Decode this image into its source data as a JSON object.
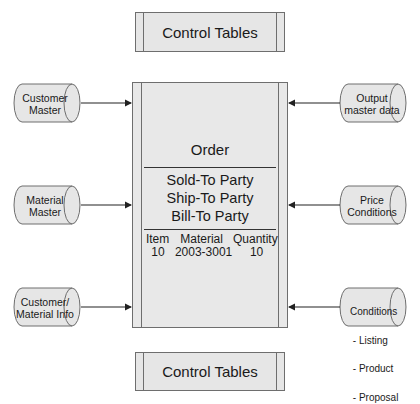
{
  "control_tables_top": {
    "label": "Control Tables"
  },
  "control_tables_bottom": {
    "label": "Control Tables"
  },
  "order": {
    "title": "Order",
    "parties": [
      "Sold-To Party",
      "Ship-To Party",
      "Bill-To Party"
    ],
    "item_headers": [
      "Item",
      "Material",
      "Quantity"
    ],
    "item_row": [
      "10",
      "2003-3001",
      "10"
    ]
  },
  "inputs_left": [
    {
      "lines": [
        "Customer",
        "Master"
      ]
    },
    {
      "lines": [
        "Material",
        "Master"
      ]
    },
    {
      "lines": [
        "Customer/",
        "Material Info"
      ]
    }
  ],
  "inputs_right": [
    {
      "lines": [
        "Output",
        "master data"
      ]
    },
    {
      "lines": [
        "Price",
        "Conditions"
      ]
    },
    {
      "lines": [
        "Conditions",
        " - Listing",
        " - Product",
        " - Proposal"
      ]
    }
  ],
  "colors": {
    "fill": "#e6e6e6",
    "stroke": "#6e6e6e",
    "arrow": "#222222"
  }
}
